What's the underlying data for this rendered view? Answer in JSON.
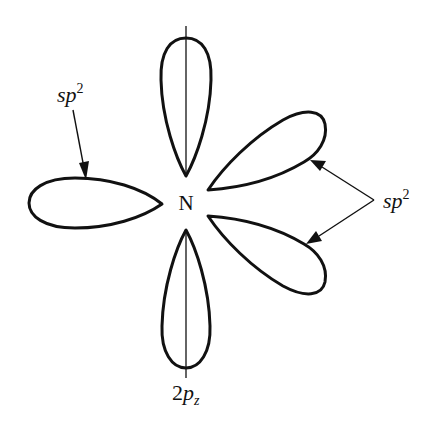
{
  "diagram": {
    "center_atom": {
      "label": "N"
    },
    "labels": {
      "sp2_left": {
        "base": "sp",
        "sup": "2"
      },
      "sp2_right": {
        "base": "sp",
        "sup": "2"
      },
      "pz": {
        "prefix": "2",
        "base": "p",
        "sub": "z"
      }
    },
    "lobes": [
      {
        "name": "pz-upper-lobe",
        "type": "2pz",
        "direction": "up"
      },
      {
        "name": "pz-lower-lobe",
        "type": "2pz",
        "direction": "down"
      },
      {
        "name": "sp2-left-lobe",
        "type": "sp2",
        "direction": "left"
      },
      {
        "name": "sp2-upper-right-lobe",
        "type": "sp2",
        "direction": "upper-right"
      },
      {
        "name": "sp2-lower-right-lobe",
        "type": "sp2",
        "direction": "lower-right"
      }
    ],
    "colors": {
      "stroke": "#111111",
      "background": "#ffffff"
    }
  }
}
